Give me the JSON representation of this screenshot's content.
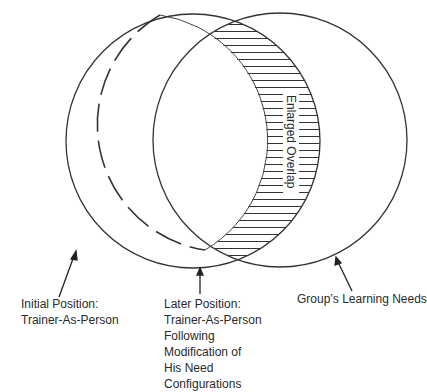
{
  "diagram": {
    "colors": {
      "stroke": "#333333",
      "text": "#2a2a2a",
      "background": "#ffffff"
    },
    "circles": [
      {
        "id": "initial-position",
        "style": "dashed",
        "cx": 140,
        "cy": 141,
        "r": 127
      },
      {
        "id": "later-position",
        "style": "solid",
        "cx": 193,
        "cy": 141,
        "r": 127
      },
      {
        "id": "group-learning-needs",
        "style": "solid",
        "cx": 280,
        "cy": 140,
        "r": 127
      }
    ],
    "overlap_label": "Enlarged Overlap",
    "labels": {
      "initial": [
        "Initial Position:",
        "Trainer-As-Person"
      ],
      "later": [
        "Later Position:",
        "Trainer-As-Person",
        "Following",
        "Modification of",
        "His Need",
        "Configurations"
      ],
      "group": [
        "Group’s Learning Needs"
      ]
    }
  }
}
